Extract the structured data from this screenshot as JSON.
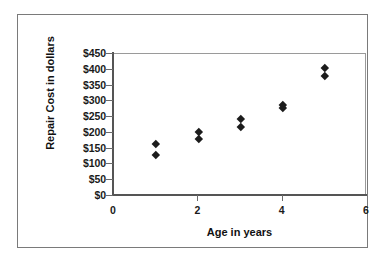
{
  "chart_data": {
    "type": "scatter",
    "title": "",
    "xlabel": "Age in years",
    "ylabel": "Repair Cost in dollars",
    "xlim": [
      0,
      6
    ],
    "ylim": [
      0,
      450
    ],
    "xticks": [
      0,
      2,
      4,
      6
    ],
    "xtick_labels": [
      "0",
      "2",
      "4",
      "6"
    ],
    "yticks": [
      0,
      50,
      100,
      150,
      200,
      250,
      300,
      350,
      400,
      450
    ],
    "ytick_labels": [
      "$0",
      "$50",
      "$100",
      "$150",
      "$200",
      "$250",
      "$300",
      "$350",
      "$400",
      "$450"
    ],
    "grid": false,
    "legend": false,
    "marker": "diamond",
    "marker_color": "#1c1c1c",
    "series": [
      {
        "name": "Repair Cost",
        "points": [
          {
            "x": 1,
            "y": 165
          },
          {
            "x": 1,
            "y": 130
          },
          {
            "x": 2,
            "y": 205
          },
          {
            "x": 2,
            "y": 180
          },
          {
            "x": 3,
            "y": 245
          },
          {
            "x": 3,
            "y": 220
          },
          {
            "x": 4,
            "y": 288
          },
          {
            "x": 4,
            "y": 278
          },
          {
            "x": 5,
            "y": 405
          },
          {
            "x": 5,
            "y": 380
          }
        ]
      }
    ]
  },
  "style": {
    "plot_border_color": "#9a9a9a",
    "axis_color": "#555555",
    "tick_color": "#6b6b6b",
    "outer_border_color": "#7a7a7a",
    "background": "#ffffff",
    "text_color": "#111111"
  }
}
